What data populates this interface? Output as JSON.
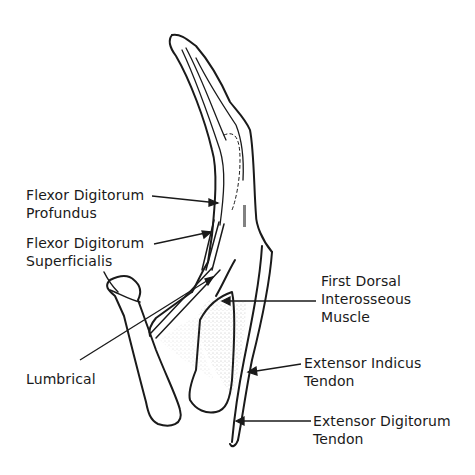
{
  "diagram": {
    "ink_color": "#1a1a1a",
    "background": "#ffffff",
    "labels": [
      {
        "id": "fdp",
        "line1": "Flexor Digitorum",
        "line2": "Profundus"
      },
      {
        "id": "fds",
        "line1": "Flexor Digitorum",
        "line2": "Superficialis"
      },
      {
        "id": "fdi",
        "line1": "First Dorsal",
        "line2": "Interosseous",
        "line3": "Muscle"
      },
      {
        "id": "lumbrical",
        "line1": "Lumbrical"
      },
      {
        "id": "eit",
        "line1": "Extensor Indicus",
        "line2": "Tendon"
      },
      {
        "id": "edt",
        "line1": "Extensor Digitorum",
        "line2": "Tendon"
      }
    ]
  }
}
